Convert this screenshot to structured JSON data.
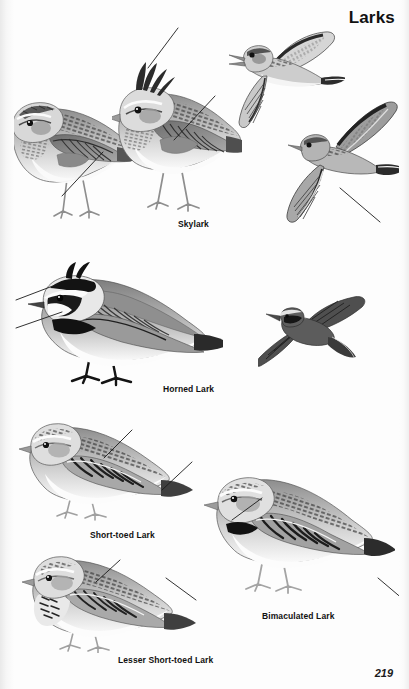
{
  "plate": {
    "title": "Larks",
    "page_number": "219",
    "background_color": "#fdfdfd",
    "ink_color": "#111111"
  },
  "captions": [
    {
      "id": "skylark",
      "label": "Skylark",
      "x": 178,
      "y": 219
    },
    {
      "id": "horned-lark",
      "label": "Horned Lark",
      "x": 163,
      "y": 384
    },
    {
      "id": "short-toed-lark",
      "label": "Short-toed Lark",
      "x": 90,
      "y": 530
    },
    {
      "id": "bimaculated-lark",
      "label": "Bimaculated Lark",
      "x": 262,
      "y": 611
    },
    {
      "id": "lesser-short-toed",
      "label": "Lesser Short-toed Lark",
      "x": 118,
      "y": 655
    }
  ],
  "figures": [
    {
      "id": "skylark-perched-left",
      "species": "Skylark",
      "pose": "perched, side view, facing left",
      "x": 5,
      "y": 85,
      "w": 130,
      "h": 145
    },
    {
      "id": "skylark-perched-crest",
      "species": "Skylark",
      "pose": "perched with raised crest, facing left",
      "x": 112,
      "y": 52,
      "w": 130,
      "h": 170
    },
    {
      "id": "skylark-singing-flight",
      "species": "Skylark",
      "pose": "song flight, bill open, wings raised",
      "x": 225,
      "y": 28,
      "w": 120,
      "h": 100
    },
    {
      "id": "skylark-flight-below",
      "species": "Skylark",
      "pose": "gliding flight, viewed from below",
      "x": 278,
      "y": 95,
      "w": 128,
      "h": 135
    },
    {
      "id": "horned-lark-perched",
      "species": "Horned Lark",
      "pose": "perched, side view, facing left, horns raised",
      "x": 18,
      "y": 258,
      "w": 205,
      "h": 130
    },
    {
      "id": "horned-lark-flight",
      "species": "Horned Lark",
      "pose": "flight, viewed from above, dark upperparts",
      "x": 258,
      "y": 295,
      "w": 118,
      "h": 80
    },
    {
      "id": "short-toed-lark",
      "species": "Short-toed Lark",
      "pose": "perched, side view, facing left",
      "x": 15,
      "y": 412,
      "w": 180,
      "h": 110
    },
    {
      "id": "bimaculated-lark",
      "species": "Bimaculated Lark",
      "pose": "perched, side view, facing left, neck patches",
      "x": 200,
      "y": 458,
      "w": 195,
      "h": 140
    },
    {
      "id": "lesser-short-toed-lark",
      "species": "Lesser Short-toed Lark",
      "pose": "perched, side view, facing left, streaked breast",
      "x": 18,
      "y": 543,
      "w": 180,
      "h": 110
    }
  ],
  "leader_lines": [
    {
      "id": "leader-skylark-crest",
      "points_to": "raised crest",
      "x1": 178,
      "y1": 28,
      "x2": 148,
      "y2": 68
    },
    {
      "id": "leader-skylark-mantle",
      "points_to": "mantle streaking",
      "x1": 215,
      "y1": 96,
      "x2": 174,
      "y2": 140
    },
    {
      "id": "leader-skylark-left-flank",
      "points_to": "flank patch",
      "x1": 103,
      "y1": 152,
      "x2": 62,
      "y2": 196
    },
    {
      "id": "leader-skylark-wing-edge",
      "points_to": "white trailing edge",
      "x1": 380,
      "y1": 222,
      "x2": 340,
      "y2": 188
    },
    {
      "id": "leader-horned-lark-face",
      "points_to": "black face mask",
      "x1": 16,
      "y1": 300,
      "x2": 58,
      "y2": 284
    },
    {
      "id": "leader-horned-lark-breast",
      "points_to": "black breast band",
      "x1": 16,
      "y1": 328,
      "x2": 62,
      "y2": 312
    },
    {
      "id": "leader-short-toed-wing",
      "points_to": "wing coverts",
      "x1": 132,
      "y1": 430,
      "x2": 104,
      "y2": 458
    },
    {
      "id": "leader-short-toed-tail",
      "points_to": "tail pattern",
      "x1": 192,
      "y1": 462,
      "x2": 162,
      "y2": 490
    },
    {
      "id": "leader-bimaculated-neck",
      "points_to": "neck patch",
      "x1": 232,
      "y1": 520,
      "x2": 262,
      "y2": 498
    },
    {
      "id": "leader-bimaculated-tail",
      "points_to": "tail tip",
      "x1": 404,
      "y1": 600,
      "x2": 378,
      "y2": 578
    },
    {
      "id": "leader-lesser-breast",
      "points_to": "breast streaking",
      "x1": 120,
      "y1": 560,
      "x2": 96,
      "y2": 582
    },
    {
      "id": "leader-lesser-tail",
      "points_to": "tail",
      "x1": 196,
      "y1": 600,
      "x2": 166,
      "y2": 578
    }
  ]
}
